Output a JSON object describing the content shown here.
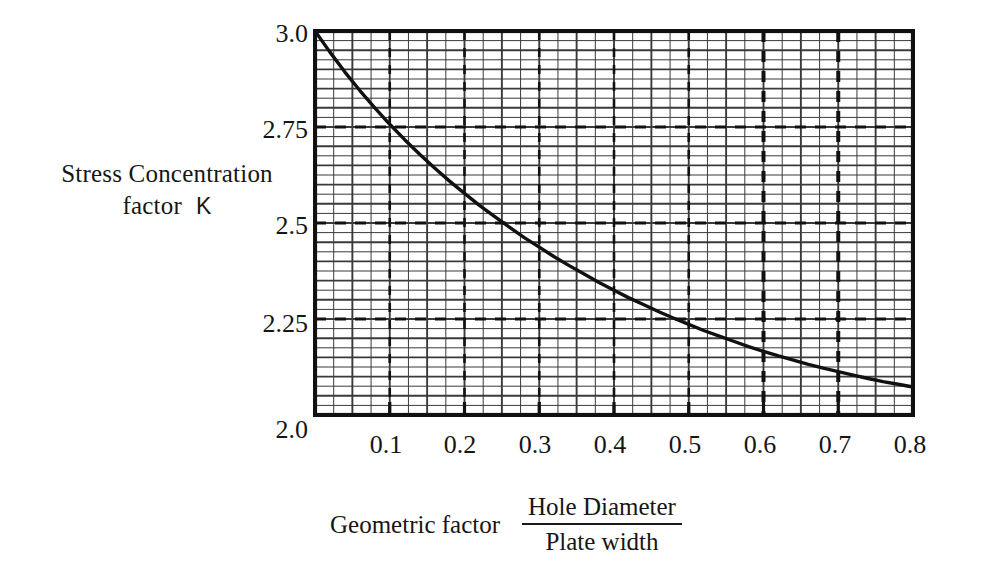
{
  "chart_data": {
    "type": "line",
    "title": "",
    "xlabel": "Geometric factor  Hole Diameter / Plate width",
    "xlabel_lead": "Geometric factor",
    "xlabel_numerator": "Hole Diameter",
    "xlabel_denominator": "Plate width",
    "ylabel": "Stress Concentration factor K",
    "ylabel_line1": "Stress Concentration",
    "ylabel_line2": "factor",
    "ylabel_symbol": "K",
    "xlim": [
      0.0,
      0.8
    ],
    "ylim": [
      2.0,
      3.0
    ],
    "x_tick_labels": [
      "0.1",
      "0.2",
      "0.3",
      "0.4",
      "0.5",
      "0.6",
      "0.7",
      "0.8"
    ],
    "x_tick_values": [
      0.1,
      0.2,
      0.3,
      0.4,
      0.5,
      0.6,
      0.7,
      0.8
    ],
    "y_tick_labels": [
      "3.0",
      "2.75",
      "2.5",
      "2.25",
      "2.0"
    ],
    "y_tick_values": [
      3.0,
      2.75,
      2.5,
      2.25,
      2.0
    ],
    "grid": true,
    "grid_minor_step_x": 0.025,
    "grid_minor_step_y": 0.025,
    "grid_major_step_x": 0.05,
    "grid_major_step_y": 0.05,
    "dashed_vertical_guides": [
      0.1,
      0.2,
      0.3,
      0.4,
      0.5,
      0.6,
      0.7
    ],
    "dashed_vertical_emphasis": [
      0.6,
      0.7
    ],
    "dashed_horizontal_guides": [
      2.75,
      2.5,
      2.25
    ],
    "legend": null,
    "line_color": "#111111",
    "grid_color": "#3a3a3a",
    "axis_color": "#111111",
    "series": [
      {
        "name": "Stress concentration factor",
        "x": [
          0.0,
          0.02,
          0.04,
          0.06,
          0.08,
          0.1,
          0.12,
          0.14,
          0.16,
          0.18,
          0.2,
          0.22,
          0.24,
          0.26,
          0.28,
          0.3,
          0.32,
          0.34,
          0.36,
          0.38,
          0.4,
          0.42,
          0.44,
          0.46,
          0.48,
          0.5,
          0.52,
          0.54,
          0.56,
          0.58,
          0.6,
          0.62,
          0.64,
          0.66,
          0.68,
          0.7,
          0.72,
          0.74,
          0.76,
          0.78,
          0.8
        ],
        "values": [
          3.0,
          2.945,
          2.893,
          2.845,
          2.8,
          2.757,
          2.717,
          2.679,
          2.643,
          2.609,
          2.577,
          2.546,
          2.517,
          2.489,
          2.462,
          2.437,
          2.412,
          2.389,
          2.367,
          2.345,
          2.325,
          2.305,
          2.287,
          2.269,
          2.252,
          2.236,
          2.22,
          2.206,
          2.192,
          2.178,
          2.166,
          2.154,
          2.143,
          2.132,
          2.122,
          2.113,
          2.104,
          2.095,
          2.087,
          2.08,
          2.073
        ]
      }
    ]
  },
  "axes": {
    "y_title_line1": "Stress Concentration",
    "y_title_line2": "factor",
    "y_title_symbol": "K"
  }
}
